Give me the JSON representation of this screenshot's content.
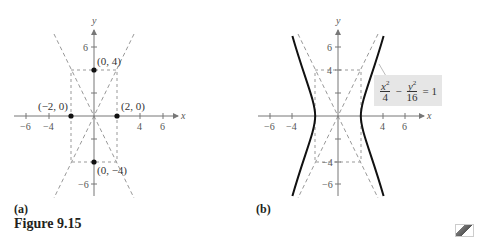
{
  "figure": {
    "caption": "Figure 9.15",
    "panels": [
      {
        "label": "(a)",
        "axis_x": "x",
        "axis_y": "y",
        "x_ticks": [
          "−6",
          "−4",
          "4",
          "6"
        ],
        "y_ticks": [
          "6",
          "−6"
        ],
        "points": [
          {
            "label": "(0, 4)",
            "x": 0,
            "y": 4
          },
          {
            "label": "(−2, 0)",
            "x": -2,
            "y": 0
          },
          {
            "label": "(2, 0)",
            "x": 2,
            "y": 0
          },
          {
            "label": "(0, −4)",
            "x": 0,
            "y": -4
          }
        ]
      },
      {
        "label": "(b)",
        "axis_x": "x",
        "axis_y": "y",
        "x_ticks": [
          "−6",
          "−4",
          "4",
          "6"
        ],
        "y_ticks": [
          "6",
          "4",
          "−4",
          "−6"
        ],
        "equation": {
          "term1_num": "x",
          "term1_exp": "2",
          "term1_den": "4",
          "operator": "−",
          "term2_num": "y",
          "term2_exp": "2",
          "term2_den": "16",
          "rhs": "= 1"
        }
      }
    ]
  },
  "icons": {
    "corner": "calculator-icon"
  }
}
